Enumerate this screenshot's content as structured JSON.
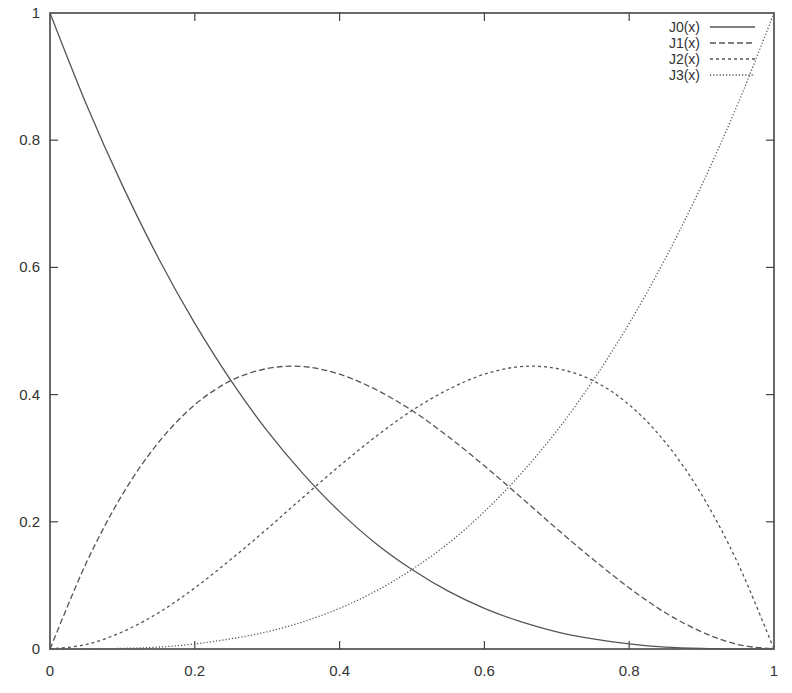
{
  "chart_data": {
    "type": "line",
    "title": "",
    "xlabel": "",
    "ylabel": "",
    "xlim": [
      0,
      1
    ],
    "ylim": [
      0,
      1
    ],
    "grid": false,
    "legend_position": "top-right-inside",
    "x_ticks": [
      0,
      0.2,
      0.4,
      0.6,
      0.8,
      1
    ],
    "x_tick_labels": [
      "0",
      "0.2",
      "0.4",
      "0.6",
      "0.8",
      "1"
    ],
    "y_ticks": [
      0,
      0.2,
      0.4,
      0.6,
      0.8,
      1
    ],
    "y_tick_labels": [
      "0",
      "0.2",
      "0.4",
      "0.6",
      "0.8",
      "1"
    ],
    "x": [
      0,
      0.05,
      0.1,
      0.15,
      0.2,
      0.25,
      0.3,
      0.35,
      0.4,
      0.45,
      0.5,
      0.55,
      0.6,
      0.65,
      0.7,
      0.75,
      0.8,
      0.85,
      0.9,
      0.95,
      1
    ],
    "series": [
      {
        "name": "J0(x)",
        "style": "solid",
        "values": [
          1,
          0.857,
          0.729,
          0.614,
          0.512,
          0.422,
          0.343,
          0.275,
          0.216,
          0.166,
          0.125,
          0.091,
          0.064,
          0.043,
          0.027,
          0.016,
          0.008,
          0.003,
          0.001,
          0.0001,
          0
        ]
      },
      {
        "name": "J1(x)",
        "style": "dashed",
        "values": [
          0,
          0.135,
          0.243,
          0.325,
          0.384,
          0.422,
          0.441,
          0.444,
          0.432,
          0.408,
          0.375,
          0.334,
          0.288,
          0.239,
          0.189,
          0.141,
          0.096,
          0.057,
          0.027,
          0.007,
          0
        ]
      },
      {
        "name": "J2(x)",
        "style": "short-dashed",
        "values": [
          0,
          0.007,
          0.027,
          0.057,
          0.096,
          0.141,
          0.189,
          0.239,
          0.288,
          0.334,
          0.375,
          0.408,
          0.432,
          0.444,
          0.441,
          0.422,
          0.384,
          0.325,
          0.243,
          0.135,
          0
        ]
      },
      {
        "name": "J3(x)",
        "style": "dotted",
        "values": [
          0,
          0.0001,
          0.001,
          0.003,
          0.008,
          0.016,
          0.027,
          0.043,
          0.064,
          0.091,
          0.125,
          0.166,
          0.216,
          0.275,
          0.343,
          0.422,
          0.512,
          0.614,
          0.729,
          0.857,
          1
        ]
      }
    ]
  },
  "legend": {
    "items": [
      {
        "label": "J0(x)"
      },
      {
        "label": "J1(x)"
      },
      {
        "label": "J2(x)"
      },
      {
        "label": "J3(x)"
      }
    ]
  },
  "colors": {
    "axis": "#444444",
    "line": "#555555",
    "background": "#ffffff"
  }
}
